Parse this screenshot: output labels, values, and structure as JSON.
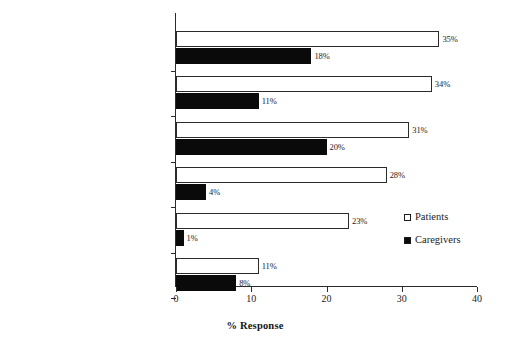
{
  "chart_data": {
    "type": "bar",
    "orientation": "horizontal",
    "title": "",
    "xlabel": "% Response",
    "ylabel": "",
    "xlim": [
      0,
      40
    ],
    "xticks": [
      0,
      10,
      20,
      30,
      40
    ],
    "xtick_labels": [
      "0",
      "10",
      "20",
      "30",
      "40"
    ],
    "grid": false,
    "legend_position": "right-middle",
    "categories": [
      "Accepted fewer responsibilities",
      "Reduced work hours",
      "Took days off work",
      "Stopped working altogether",
      "Went on disability",
      "Used unpaid family and medical leave time"
    ],
    "series": [
      {
        "name": "Patients",
        "color": "#ffffff",
        "edge_color": "#2b2b2b",
        "values": [
          35,
          34,
          31,
          28,
          23,
          11
        ],
        "value_labels": [
          "35%",
          "34%",
          "31%",
          "28%",
          "23%",
          "11%"
        ]
      },
      {
        "name": "Caregivers",
        "color": "#0a0a0a",
        "edge_color": "#0a0a0a",
        "values": [
          18,
          11,
          20,
          4,
          1,
          8
        ],
        "value_labels": [
          "18%",
          "11%",
          "20%",
          "4%",
          "1%",
          "8%"
        ]
      }
    ]
  },
  "legend": {
    "items": [
      {
        "label": "Patients",
        "swatch": "hollow"
      },
      {
        "label": "Caregivers",
        "swatch": "filled"
      }
    ]
  }
}
